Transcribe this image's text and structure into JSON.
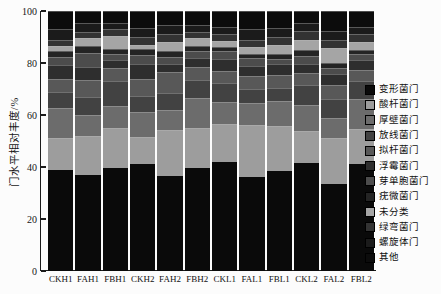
{
  "figure": {
    "background": "#fcfcfc",
    "axis_color": "#1b1b1b",
    "text_color": "#161616"
  },
  "chart_data": {
    "type": "bar",
    "stacked": true,
    "title": "",
    "xlabel": "",
    "ylabel": "门水平相对丰度/%",
    "ylim": [
      0,
      100
    ],
    "y_ticks": [
      0,
      20,
      40,
      60,
      80,
      100
    ],
    "grid": false,
    "legend_position": "right",
    "categories": [
      "CKH1",
      "FAH1",
      "FBH1",
      "CKH2",
      "FAH2",
      "FBH2",
      "CKL1",
      "FAL1",
      "FBL1",
      "CKL2",
      "FAL2",
      "FBL2"
    ],
    "series": [
      {
        "name": "变形菌门",
        "color": "#0a0a0a",
        "values": [
          39.0,
          37.0,
          39.5,
          41.0,
          36.5,
          39.5,
          42.0,
          36.0,
          38.5,
          41.5,
          33.5,
          41.0
        ]
      },
      {
        "name": "酸杆菌门",
        "color": "#9d9d9d",
        "values": [
          12.2,
          15.0,
          15.5,
          10.5,
          17.8,
          15.5,
          14.5,
          20.3,
          17.2,
          12.2,
          17.7,
          13.5
        ]
      },
      {
        "name": "厚壁菌门",
        "color": "#6c6c6c",
        "values": [
          11.5,
          8.0,
          8.5,
          9.5,
          7.6,
          11.5,
          8.5,
          8.2,
          9.6,
          10.3,
          7.6,
          11.5
        ]
      },
      {
        "name": "放线菌门",
        "color": "#424242",
        "values": [
          6.0,
          7.0,
          9.5,
          6.5,
          6.4,
          7.0,
          7.5,
          5.5,
          5.2,
          7.7,
          7.2,
          7.0
        ]
      },
      {
        "name": "拟杆菌门",
        "color": "#585858",
        "values": [
          5.3,
          6.5,
          5.0,
          6.5,
          8.4,
          5.0,
          4.5,
          5.0,
          5.0,
          4.5,
          5.7,
          4.5
        ]
      },
      {
        "name": "浮霉菌门",
        "color": "#2e2e2e",
        "values": [
          5.3,
          5.0,
          3.0,
          5.5,
          3.1,
          3.5,
          4.5,
          4.0,
          4.0,
          3.5,
          4.2,
          3.5
        ]
      },
      {
        "name": "芽单胞菌门",
        "color": "#4c4c4c",
        "values": [
          3.0,
          5.5,
          2.5,
          3.5,
          2.5,
          2.5,
          3.0,
          3.0,
          2.0,
          3.0,
          2.2,
          2.5
        ]
      },
      {
        "name": "疣微菌门",
        "color": "#242424",
        "values": [
          2.4,
          2.5,
          2.0,
          2.5,
          2.5,
          2.0,
          1.5,
          1.5,
          2.0,
          2.5,
          1.9,
          1.5
        ]
      },
      {
        "name": "未分类",
        "color": "#a5a5a5",
        "values": [
          1.7,
          3.0,
          5.0,
          1.5,
          3.5,
          3.0,
          2.5,
          2.5,
          3.5,
          3.5,
          5.8,
          3.0
        ]
      },
      {
        "name": "绿弯菌门",
        "color": "#333333",
        "values": [
          2.6,
          2.5,
          2.5,
          3.0,
          2.7,
          2.5,
          2.5,
          3.0,
          3.0,
          3.8,
          3.2,
          3.0
        ]
      },
      {
        "name": "螺旋体门",
        "color": "#1b1b1b",
        "values": [
          4.0,
          3.5,
          2.5,
          3.5,
          3.5,
          2.5,
          3.0,
          4.0,
          3.5,
          3.0,
          3.5,
          3.0
        ]
      },
      {
        "name": "其他",
        "color": "#0c0c0c",
        "values": [
          7.0,
          4.5,
          4.5,
          6.5,
          5.5,
          5.5,
          6.0,
          7.0,
          6.5,
          4.5,
          7.5,
          6.0
        ]
      }
    ]
  }
}
